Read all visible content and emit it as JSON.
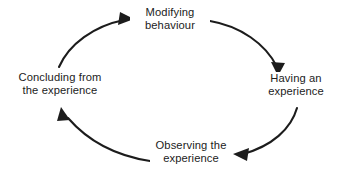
{
  "diagram": {
    "shape": "ellipse",
    "direction": "clockwise",
    "stroke_color": "#1c1c1c",
    "text_color": "#1c1c1c",
    "background_color": "#ffffff",
    "nodes": [
      {
        "id": "modifying",
        "position": "top",
        "line1": "Modifying",
        "line2": "behaviour"
      },
      {
        "id": "having",
        "position": "right",
        "line1": "Having an",
        "line2": "experience"
      },
      {
        "id": "observing",
        "position": "bottom",
        "line1": "Observing the",
        "line2": "experience"
      },
      {
        "id": "concluding",
        "position": "left",
        "line1": "Concluding from",
        "line2": "the experience"
      }
    ],
    "arrows": [
      {
        "id": "modifying-to-having",
        "from": "modifying",
        "to": "having",
        "arrowhead": "down-right"
      },
      {
        "id": "having-to-observing",
        "from": "having",
        "to": "observing",
        "arrowhead": "left"
      },
      {
        "id": "observing-to-concluding",
        "from": "observing",
        "to": "concluding",
        "arrowhead": "up-left"
      },
      {
        "id": "concluding-to-modifying",
        "from": "concluding",
        "to": "modifying",
        "arrowhead": "right"
      }
    ]
  }
}
